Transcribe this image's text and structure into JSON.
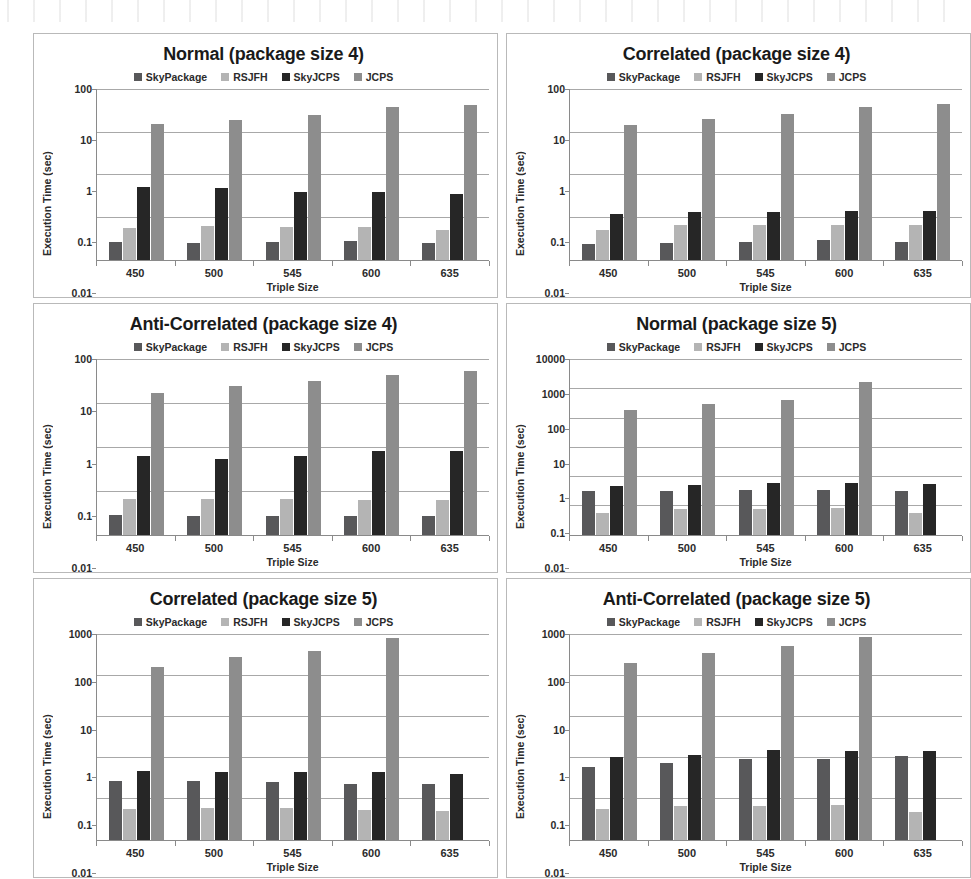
{
  "figure": {
    "series_names": [
      "SkyPackage",
      "RSJFH",
      "SkyJCPS",
      "JCPS"
    ],
    "series_colors": [
      "#58585a",
      "#b4b4b4",
      "#262626",
      "#8d8d8d"
    ],
    "xlabel": "Triple Size",
    "ylabel": "Execution Time (sec)",
    "categories": [
      "450",
      "500",
      "545",
      "600",
      "635"
    ]
  },
  "chart_data": [
    {
      "type": "bar",
      "title": "Normal (package size 4)",
      "xlabel": "Triple Size",
      "ylabel": "Execution Time (sec)",
      "yscale": "log",
      "ylim": [
        0.01,
        100
      ],
      "yticks": [
        "0.01",
        "0.1",
        "1",
        "10",
        "100"
      ],
      "grid": true,
      "legend": "top",
      "categories": [
        "450",
        "500",
        "545",
        "600",
        "635"
      ],
      "series": [
        {
          "name": "SkyPackage",
          "values": [
            0.026,
            0.024,
            0.026,
            0.027,
            0.024
          ]
        },
        {
          "name": "RSJFH",
          "values": [
            0.055,
            0.06,
            0.058,
            0.058,
            0.05
          ]
        },
        {
          "name": "SkyJCPS",
          "values": [
            0.5,
            0.48,
            0.39,
            0.39,
            0.35
          ]
        },
        {
          "name": "JCPS",
          "values": [
            15.0,
            19.0,
            25.0,
            37.0,
            43.0
          ]
        }
      ]
    },
    {
      "type": "bar",
      "title": "Correlated (package size 4)",
      "xlabel": "Triple Size",
      "ylabel": "Execution Time (sec)",
      "yscale": "log",
      "ylim": [
        0.01,
        100
      ],
      "yticks": [
        "0.01",
        "0.1",
        "1",
        "10",
        "100"
      ],
      "grid": true,
      "legend": "top",
      "categories": [
        "450",
        "500",
        "545",
        "600",
        "635"
      ],
      "series": [
        {
          "name": "SkyPackage",
          "values": [
            0.023,
            0.025,
            0.026,
            0.028,
            0.026
          ]
        },
        {
          "name": "RSJFH",
          "values": [
            0.05,
            0.063,
            0.066,
            0.064,
            0.065
          ]
        },
        {
          "name": "SkyJCPS",
          "values": [
            0.12,
            0.128,
            0.128,
            0.138,
            0.138
          ]
        },
        {
          "name": "JCPS",
          "values": [
            14.0,
            19.5,
            26.0,
            37.0,
            45.0
          ]
        }
      ]
    },
    {
      "type": "bar",
      "title": "Anti-Correlated (package size 4)",
      "xlabel": "Triple Size",
      "ylabel": "Execution Time (sec)",
      "yscale": "log",
      "ylim": [
        0.01,
        100
      ],
      "yticks": [
        "0.01",
        "0.1",
        "1",
        "10",
        "100"
      ],
      "grid": true,
      "legend": "top",
      "categories": [
        "450",
        "500",
        "545",
        "600",
        "635"
      ],
      "series": [
        {
          "name": "SkyPackage",
          "values": [
            0.028,
            0.026,
            0.027,
            0.027,
            0.026
          ]
        },
        {
          "name": "RSJFH",
          "values": [
            0.064,
            0.063,
            0.063,
            0.061,
            0.061
          ]
        },
        {
          "name": "SkyJCPS",
          "values": [
            0.62,
            0.54,
            0.6,
            0.8,
            0.82
          ]
        },
        {
          "name": "JCPS",
          "values": [
            17.0,
            24.0,
            32.0,
            43.0,
            52.0
          ]
        }
      ]
    },
    {
      "type": "bar",
      "title": "Normal (package size 5)",
      "xlabel": "Triple Size",
      "ylabel": "Execution Time (sec)",
      "yscale": "log",
      "ylim": [
        0.01,
        10000
      ],
      "yticks": [
        "0.01",
        "0.1",
        "1",
        "10",
        "100",
        "1000",
        "10000"
      ],
      "grid": true,
      "legend": "top",
      "categories": [
        "450",
        "500",
        "545",
        "600",
        "635"
      ],
      "series": [
        {
          "name": "SkyPackage",
          "values": [
            0.31,
            0.3,
            0.33,
            0.32,
            0.31
          ]
        },
        {
          "name": "RSJFH",
          "values": [
            0.056,
            0.075,
            0.073,
            0.082,
            0.055
          ]
        },
        {
          "name": "SkyJCPS",
          "values": [
            0.47,
            0.49,
            0.57,
            0.58,
            0.54
          ]
        },
        {
          "name": "JCPS",
          "values": [
            180,
            290,
            400,
            1700,
            null
          ]
        }
      ]
    },
    {
      "type": "bar",
      "title": "Correlated (package size 5)",
      "xlabel": "Triple Size",
      "ylabel": "Execution Time (sec)",
      "yscale": "log",
      "ylim": [
        0.01,
        1000
      ],
      "yticks": [
        "0.01",
        "0.1",
        "1",
        "10",
        "100",
        "1000"
      ],
      "grid": true,
      "legend": "top",
      "categories": [
        "450",
        "500",
        "545",
        "600",
        "635"
      ],
      "series": [
        {
          "name": "SkyPackage",
          "values": [
            0.27,
            0.26,
            0.25,
            0.23,
            0.22
          ]
        },
        {
          "name": "RSJFH",
          "values": [
            0.056,
            0.06,
            0.057,
            0.051,
            0.05
          ]
        },
        {
          "name": "SkyJCPS",
          "values": [
            0.46,
            0.44,
            0.44,
            0.44,
            0.4
          ]
        },
        {
          "name": "JCPS",
          "values": [
            160,
            270,
            380,
            800,
            null
          ]
        }
      ]
    },
    {
      "type": "bar",
      "title": "Anti-Correlated (package size 5)",
      "xlabel": "Triple Size",
      "ylabel": "Execution Time (sec)",
      "yscale": "log",
      "ylim": [
        0.01,
        1000
      ],
      "yticks": [
        "0.01",
        "0.1",
        "1",
        "10",
        "100",
        "1000"
      ],
      "grid": true,
      "legend": "top",
      "categories": [
        "450",
        "500",
        "545",
        "600",
        "635"
      ],
      "series": [
        {
          "name": "SkyPackage",
          "values": [
            0.57,
            0.72,
            0.9,
            0.92,
            1.08
          ]
        },
        {
          "name": "RSJFH",
          "values": [
            0.056,
            0.064,
            0.065,
            0.07,
            0.048
          ]
        },
        {
          "name": "SkyJCPS",
          "values": [
            1.0,
            1.13,
            1.5,
            1.4,
            1.45
          ]
        },
        {
          "name": "JCPS",
          "values": [
            200,
            350,
            520,
            850,
            null
          ]
        }
      ]
    }
  ]
}
